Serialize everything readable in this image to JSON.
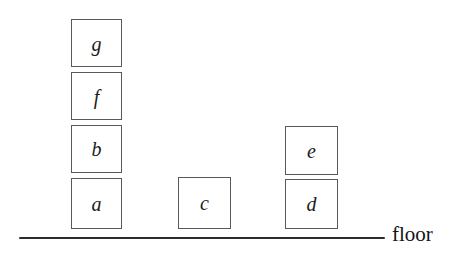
{
  "diagram": {
    "background_color": "#ffffff",
    "block_outline_color": "#59595c",
    "label_color": "#1c1c1c",
    "floor": {
      "label": "floor",
      "line_color": "#2b2b2e",
      "line_x_start": 19,
      "line_x_end": 385,
      "line_y": 237,
      "line_thickness": 1.6,
      "label_x": 392,
      "label_y": 224
    },
    "blocks": [
      {
        "label": "g",
        "x": 71,
        "y": 19,
        "w": 51,
        "h": 48,
        "stack": "stack-1",
        "level": 4
      },
      {
        "label": "f",
        "x": 71,
        "y": 72,
        "w": 51,
        "h": 48,
        "stack": "stack-1",
        "level": 3
      },
      {
        "label": "b",
        "x": 71,
        "y": 125,
        "w": 51,
        "h": 48,
        "stack": "stack-1",
        "level": 2
      },
      {
        "label": "a",
        "x": 71,
        "y": 178,
        "w": 51,
        "h": 51,
        "stack": "stack-1",
        "level": 1
      },
      {
        "label": "c",
        "x": 178,
        "y": 177,
        "w": 53,
        "h": 52,
        "stack": "stack-2",
        "level": 1
      },
      {
        "label": "e",
        "x": 285,
        "y": 126,
        "w": 53,
        "h": 49,
        "stack": "stack-3",
        "level": 2
      },
      {
        "label": "d",
        "x": 285,
        "y": 179,
        "w": 53,
        "h": 50,
        "stack": "stack-3",
        "level": 1
      }
    ]
  }
}
